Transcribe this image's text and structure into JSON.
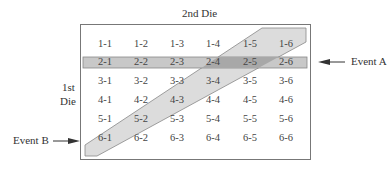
{
  "title": "2nd Die",
  "row_axis_label_line1": "1st",
  "row_axis_label_line2": "Die",
  "event_a_label": "Event A",
  "event_b_label": "Event B",
  "colors": {
    "frame": "#777777",
    "event_a_fill": "#c8c8c8",
    "event_b_fill": "#dcdcdc",
    "overlap_fill": "#a8a8a8"
  },
  "grid": {
    "rows": [
      [
        "1-1",
        "1-2",
        "1-3",
        "1-4",
        "1-5",
        "1-6"
      ],
      [
        "2-1",
        "2-2",
        "2-3",
        "2-4",
        "2-5",
        "2-6"
      ],
      [
        "3-1",
        "3-2",
        "3-3",
        "3-4",
        "3-5",
        "3-6"
      ],
      [
        "4-1",
        "4-2",
        "4-3",
        "4-4",
        "4-5",
        "4-6"
      ],
      [
        "5-1",
        "5-2",
        "5-3",
        "5-4",
        "5-5",
        "5-6"
      ],
      [
        "6-1",
        "6-2",
        "6-3",
        "6-4",
        "6-5",
        "6-6"
      ]
    ]
  }
}
